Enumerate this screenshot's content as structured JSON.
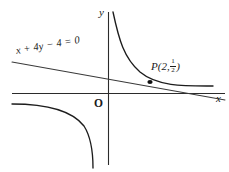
{
  "figure": {
    "type": "math-diagram",
    "background_color": "#ffffff",
    "stroke_color": "#1c1c1c",
    "width": 229,
    "height": 172
  },
  "axes": {
    "x_label": "x",
    "y_label": "y",
    "origin_label": "O",
    "x_axis_y_px": 93,
    "y_axis_x_px": 108
  },
  "labels": {
    "equation": "x + 4y − 4 = 0",
    "point_name": "P",
    "point_open_paren": "(",
    "point_x": "2",
    "point_comma": ",",
    "fraction_numerator": "1",
    "fraction_denominator": "2",
    "point_close_paren": ")"
  },
  "chart_data": {
    "type": "line",
    "title": "",
    "xlabel": "x",
    "ylabel": "y",
    "grid": false,
    "legend": false,
    "series": [
      {
        "name": "hyperbola-branch-quadrant-1",
        "equation": "y = 1/x",
        "path": "M 113 12 C 119 40, 124 58, 140 72 C 158 87, 186 86, 213 86"
      },
      {
        "name": "hyperbola-branch-quadrant-3",
        "equation": "y = 1/x",
        "path": "M 12 104 C 40 104, 70 108, 84 126 C 91 137, 93 154, 93 168"
      },
      {
        "name": "tangent-line",
        "equation": "x + 4y - 4 = 0",
        "path": "M 12 62 L 225 100"
      }
    ],
    "annotations": [
      {
        "name": "tangency-point-P",
        "label": "P(2, 1/2)",
        "x_value": 2,
        "y_value": 0.5,
        "px": 150,
        "py": 82
      }
    ]
  }
}
